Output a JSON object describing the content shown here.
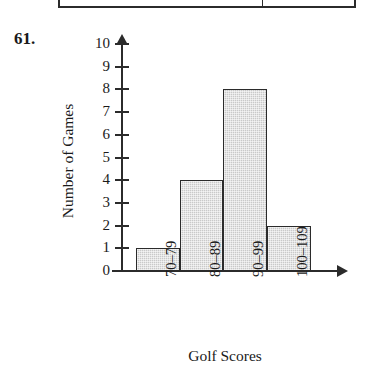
{
  "problem": {
    "number": "61."
  },
  "table_fragment": {
    "present": true,
    "description": "bottom-edge-of-table-above"
  },
  "chart_data": {
    "type": "bar",
    "title": "",
    "subtitle": "",
    "xlabel": "Golf Scores",
    "ylabel": "Number of Games",
    "categories": [
      "70–79",
      "80–89",
      "90–99",
      "100–109"
    ],
    "values": [
      1,
      4,
      8,
      2
    ],
    "ylim": [
      0,
      10
    ],
    "ytick_labels": [
      "10",
      "9",
      "8",
      "7",
      "6",
      "5",
      "4",
      "3",
      "2",
      "1",
      "0"
    ],
    "ytick_values": [
      10,
      9,
      8,
      7,
      6,
      5,
      4,
      3,
      2,
      1,
      0
    ],
    "grid": false,
    "legend": false,
    "xtick_rotation": -90,
    "bar_fill_color": "#c9c9c9",
    "bar_edge_color": "#2b2b2b",
    "axis_color": "#2b2b2b",
    "axis_arrows": true,
    "bars_contiguous": true
  }
}
